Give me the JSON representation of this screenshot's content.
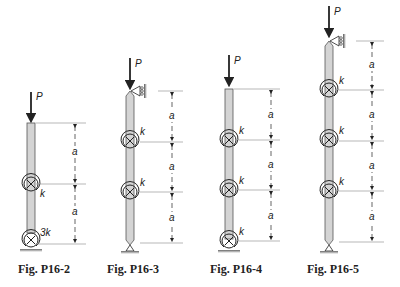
{
  "figures": [
    {
      "id": "P16-2",
      "caption": "Fig. P16-2",
      "load": "P",
      "top_support": "free",
      "bottom_support": "pin with rotational spring",
      "springs": [
        "k",
        "3k"
      ],
      "segments": [
        "a",
        "a"
      ]
    },
    {
      "id": "P16-3",
      "caption": "Fig. P16-3",
      "load": "P",
      "top_support": "roller (horizontal restraint)",
      "bottom_support": "pin",
      "springs": [
        "k",
        "k"
      ],
      "segments": [
        "a",
        "a",
        "a"
      ]
    },
    {
      "id": "P16-4",
      "caption": "Fig. P16-4",
      "load": "P",
      "top_support": "free",
      "bottom_support": "pin with rotational spring",
      "springs": [
        "k",
        "k",
        "k"
      ],
      "segments": [
        "a",
        "a",
        "a"
      ]
    },
    {
      "id": "P16-5",
      "caption": "Fig. P16-5",
      "load": "P",
      "top_support": "roller (horizontal restraint)",
      "bottom_support": "pin",
      "springs": [
        "k",
        "k",
        "k"
      ],
      "segments": [
        "a",
        "a",
        "a",
        "a"
      ]
    }
  ],
  "labels": {
    "load": "P",
    "spring": "k",
    "spring_3k": "3k",
    "length": "a"
  },
  "colors": {
    "column_fill": "#d4d4d4",
    "column_stroke": "#555555",
    "line": "#222222",
    "ground": "#777777"
  }
}
